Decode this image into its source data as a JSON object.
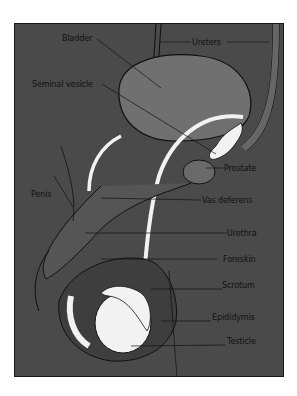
{
  "diagram": {
    "colors": {
      "background": "#4a4a4a",
      "bladder": "#707070",
      "prostate": "#6a6a6a",
      "ducts": "#f2f2f2",
      "outline": "#111111",
      "label_text": "#111111",
      "page": "#ffffff"
    },
    "labels": [
      {
        "id": "bladder",
        "text": "Bladder"
      },
      {
        "id": "ureters",
        "text": "Ureters"
      },
      {
        "id": "seminal_vesicle",
        "text": "Seminal vesicle"
      },
      {
        "id": "penis",
        "text": "Penis"
      },
      {
        "id": "prostate",
        "text": "Prostate"
      },
      {
        "id": "vas_deferens",
        "text": "Vas deferens"
      },
      {
        "id": "urethra",
        "text": "Urethra"
      },
      {
        "id": "foreskin",
        "text": "Foreskin"
      },
      {
        "id": "scrotum",
        "text": "Scrotum"
      },
      {
        "id": "epididymis",
        "text": "Epididymis"
      },
      {
        "id": "testicle",
        "text": "Testicle"
      }
    ]
  }
}
